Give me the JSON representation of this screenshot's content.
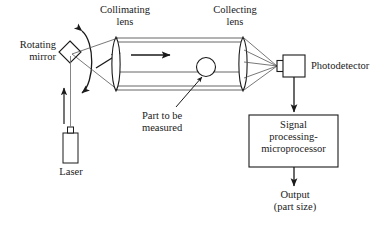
{
  "figure": {
    "type": "optical-measurement-system-diagram",
    "background_color": "#ffffff",
    "line_color": "#1a1a1a",
    "text_color": "#1a1a1a"
  },
  "labels": {
    "rotating_mirror": "Rotating\nmirror",
    "collimating_lens": "Collimating\nlens",
    "collecting_lens": "Collecting\nlens",
    "photodetector": "Photodetector",
    "part_to_be_measured": "Part to be\nmeasured",
    "laser": "Laser",
    "signal_processing": "Signal\nprocessing-\nmicroprocessor",
    "output": "Output\n(part size)"
  },
  "components": {
    "rotating_mirror": {
      "shape": "diamond",
      "cx": 70,
      "cy": 52,
      "half": 11
    },
    "rotation_arc": {
      "shape": "double-headed-arc",
      "cx": 90,
      "y_top": 28,
      "y_bottom": 92
    },
    "laser": {
      "shape": "rectangle",
      "x": 63,
      "y": 133,
      "w": 15,
      "h": 30
    },
    "laser_nozzle": {
      "shape": "rectangle",
      "x": 68,
      "y": 127,
      "w": 5,
      "h": 6
    },
    "collimating_lens": {
      "shape": "biconvex-lens",
      "cx": 116,
      "cy": 64,
      "ry": 27
    },
    "collecting_lens": {
      "shape": "biconvex-lens",
      "cx": 243,
      "cy": 64,
      "ry": 27
    },
    "part": {
      "shape": "circle",
      "cx": 206,
      "cy": 67,
      "r": 9
    },
    "photodetector": {
      "shape": "rectangle",
      "x": 283,
      "y": 55,
      "w": 22,
      "h": 22
    },
    "photodetector_nub": {
      "shape": "rectangle",
      "x": 277,
      "y": 61,
      "w": 6,
      "h": 10
    },
    "signal_box": {
      "shape": "rectangle",
      "x": 249,
      "y": 115,
      "w": 89,
      "h": 52
    },
    "beam_tube": {
      "top_lines_y": [
        38,
        42
      ],
      "bottom_lines_y": [
        86,
        90
      ],
      "mid_line_y": 72,
      "x_start": 116,
      "x_end": 243
    }
  },
  "arrows": {
    "laser_beam_up": {
      "from": [
        70,
        124
      ],
      "to": [
        70,
        86
      ],
      "style": "solid-arrow"
    },
    "beam_to_lens": {
      "from": [
        98,
        66
      ],
      "to": [
        119,
        54
      ],
      "style": "solid-arrow"
    },
    "beam_in_tube": {
      "from": [
        131,
        55
      ],
      "to": [
        172,
        55
      ],
      "style": "solid-arrow"
    },
    "photodetector_to_signal": {
      "from": [
        294,
        77
      ],
      "to": [
        294,
        113
      ],
      "style": "solid-arrow"
    },
    "signal_to_output": {
      "from": [
        294,
        167
      ],
      "to": [
        294,
        186
      ],
      "style": "solid-arrow"
    },
    "part_callout": {
      "from": [
        175,
        108
      ],
      "to": [
        203,
        79
      ],
      "style": "plain-leader"
    }
  }
}
